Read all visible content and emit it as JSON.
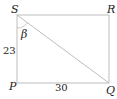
{
  "figure": {
    "type": "rectangle-with-diagonal",
    "vertices": {
      "S": "S",
      "R": "R",
      "P": "P",
      "Q": "Q"
    },
    "side_labels": {
      "SP": "23",
      "PQ": "30"
    },
    "angle_label": "β",
    "diagonal": "SQ",
    "line_color": "#bdbdbd",
    "text_color": "#222222"
  }
}
